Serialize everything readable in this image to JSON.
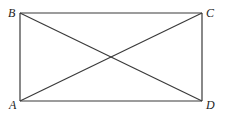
{
  "diagram": {
    "type": "geometry",
    "shape": "rectangle-with-diagonals",
    "stroke_color": "#3a3a3a",
    "label_color": "#222222",
    "vertices": [
      {
        "name": "A",
        "x": 20,
        "y": 101,
        "label_x": 9,
        "label_y": 109
      },
      {
        "name": "B",
        "x": 20,
        "y": 13,
        "label_x": 8,
        "label_y": 17
      },
      {
        "name": "C",
        "x": 202,
        "y": 13,
        "label_x": 206,
        "label_y": 17
      },
      {
        "name": "D",
        "x": 202,
        "y": 101,
        "label_x": 206,
        "label_y": 109
      }
    ],
    "segments": [
      {
        "from": "B",
        "to": "C"
      },
      {
        "from": "C",
        "to": "D"
      },
      {
        "from": "D",
        "to": "A"
      },
      {
        "from": "A",
        "to": "B"
      },
      {
        "from": "B",
        "to": "D"
      },
      {
        "from": "A",
        "to": "C"
      }
    ],
    "labels": {
      "A": "A",
      "B": "B",
      "C": "C",
      "D": "D"
    }
  }
}
